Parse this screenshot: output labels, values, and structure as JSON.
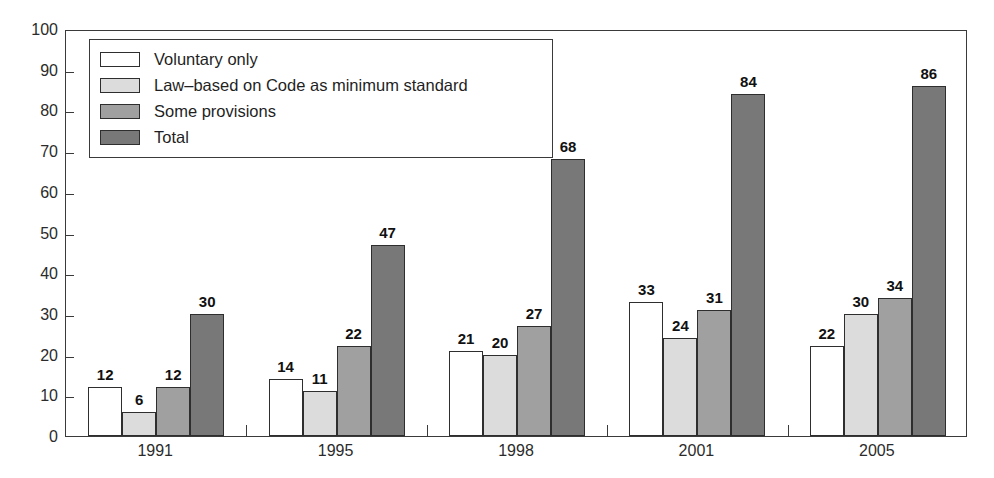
{
  "chart_data": {
    "type": "bar",
    "title": "",
    "subtitle": "",
    "xlabel": "",
    "ylabel": "",
    "ylim": [
      0,
      100
    ],
    "yticks": [
      0,
      10,
      20,
      30,
      40,
      50,
      60,
      70,
      80,
      90,
      100
    ],
    "ytick_labels": [
      "0",
      "10",
      "20",
      "30",
      "40",
      "50",
      "60",
      "70",
      "80",
      "90",
      "100"
    ],
    "grid": false,
    "legend_position": "top-left-inside",
    "categories": [
      "1991",
      "1995",
      "1998",
      "2001",
      "2005"
    ],
    "series": [
      {
        "name": "Voluntary only",
        "color": "#ffffff",
        "values": [
          12,
          14,
          21,
          33,
          22
        ],
        "value_labels": [
          "12",
          "14",
          "21",
          "33",
          "22"
        ]
      },
      {
        "name": "Law–based on Code as minimum standard",
        "color": "#dcdcdc",
        "values": [
          6,
          11,
          20,
          24,
          30
        ],
        "value_labels": [
          "6",
          "11",
          "20",
          "24",
          "30"
        ]
      },
      {
        "name": "Some provisions",
        "color": "#a0a0a0",
        "values": [
          12,
          22,
          27,
          31,
          34
        ],
        "value_labels": [
          "12",
          "22",
          "27",
          "31",
          "34"
        ]
      },
      {
        "name": "Total",
        "color": "#787878",
        "values": [
          30,
          47,
          68,
          84,
          86
        ],
        "value_labels": [
          "30",
          "47",
          "68",
          "84",
          "86"
        ]
      }
    ]
  },
  "legend": {
    "entries": [
      {
        "label": "Voluntary only",
        "swatch": "legend-swatch-voluntary-only"
      },
      {
        "label": "Law–based on Code as minimum standard",
        "swatch": "legend-swatch-law-based"
      },
      {
        "label": "Some provisions",
        "swatch": "legend-swatch-some-provisions"
      },
      {
        "label": "Total",
        "swatch": "legend-swatch-total"
      }
    ]
  },
  "axes": {
    "y_tick_labels": [
      "100",
      "90",
      "80",
      "70",
      "60",
      "50",
      "40",
      "30",
      "20",
      "10",
      "0"
    ],
    "x_tick_labels": [
      "1991",
      "1995",
      "1998",
      "2001",
      "2005"
    ]
  },
  "colors": {
    "axis": "#3a3a3a",
    "bar_outline": "#2e2e2e",
    "label_text": "#111111",
    "tick_text": "#2b2b2b",
    "series_1": "#ffffff",
    "series_2": "#dcdcdc",
    "series_3": "#a0a0a0",
    "series_4": "#787878",
    "background": "#ffffff"
  }
}
